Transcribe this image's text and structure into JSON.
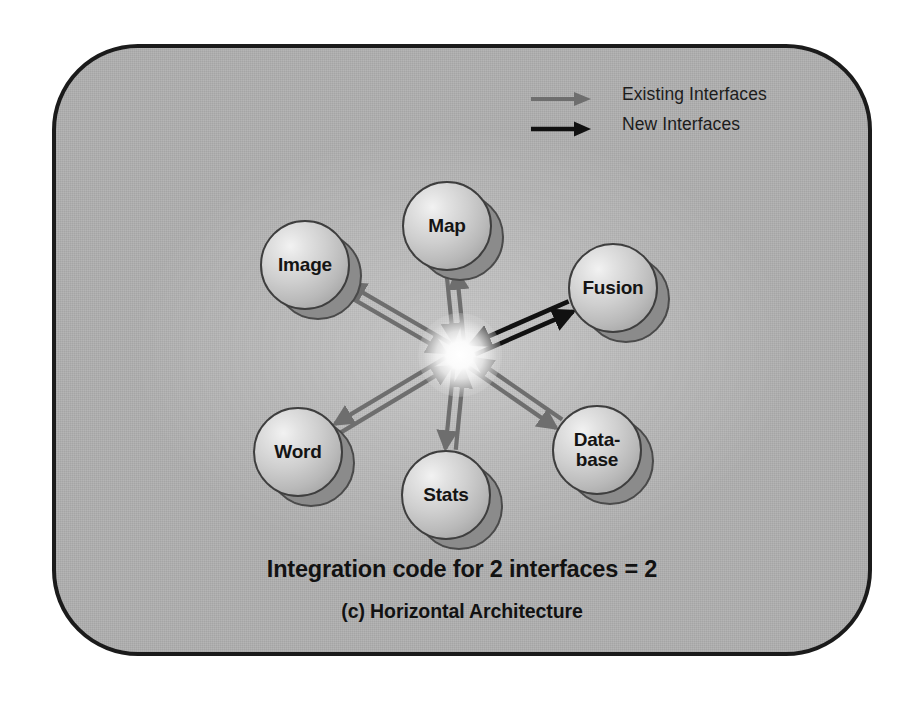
{
  "figure": {
    "caption_main": "Integration code for 2 interfaces = 2",
    "caption_sub": "(c) Horizontal Architecture",
    "panel_fill": "#b0b0b0",
    "panel_border": "#1b1b1b",
    "background": "#ffffff"
  },
  "legend": {
    "items": [
      {
        "label": "Existing Interfaces",
        "color": "#6e6e6e",
        "icon": "arrow-right-icon"
      },
      {
        "label": "New Interfaces",
        "color": "#111111",
        "icon": "arrow-right-icon"
      }
    ]
  },
  "nodes": [
    {
      "id": "image",
      "label": "Image",
      "cx": 305,
      "cy": 265,
      "r": 45
    },
    {
      "id": "map",
      "label": "Map",
      "cx": 447,
      "cy": 226,
      "r": 45
    },
    {
      "id": "fusion",
      "label": "Fusion",
      "cx": 613,
      "cy": 288,
      "r": 45
    },
    {
      "id": "word",
      "label": "Word",
      "cx": 298,
      "cy": 452,
      "r": 45
    },
    {
      "id": "stats",
      "label": "Stats",
      "cx": 446,
      "cy": 495,
      "r": 45
    },
    {
      "id": "database",
      "label": "Data-\nbase",
      "cx": 597,
      "cy": 450,
      "r": 45
    }
  ],
  "hub": {
    "cx": 460,
    "cy": 355,
    "label": ""
  },
  "links": [
    {
      "from": "image",
      "to": "hub",
      "type": "existing",
      "color": "#6e6e6e",
      "bidirectional": true
    },
    {
      "from": "map",
      "to": "hub",
      "type": "existing",
      "color": "#6e6e6e",
      "bidirectional": true
    },
    {
      "from": "fusion",
      "to": "hub",
      "type": "new",
      "color": "#111111",
      "bidirectional": true
    },
    {
      "from": "word",
      "to": "hub",
      "type": "existing",
      "color": "#6e6e6e",
      "bidirectional": true
    },
    {
      "from": "stats",
      "to": "hub",
      "type": "existing",
      "color": "#6e6e6e",
      "bidirectional": true
    },
    {
      "from": "database",
      "to": "hub",
      "type": "existing",
      "color": "#6e6e6e",
      "bidirectional": true
    }
  ],
  "chart_data": {
    "type": "diagram",
    "title": "(c) Horizontal Architecture",
    "annotation": "Integration code for 2 interfaces = 2",
    "node_count": 6,
    "link_count": 6,
    "legend_entries": [
      "Existing Interfaces",
      "New Interfaces"
    ]
  }
}
